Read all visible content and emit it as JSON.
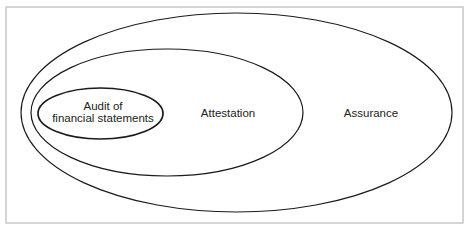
{
  "figure": {
    "kind": "nested-ellipse-euler-diagram",
    "background_color": "#ffffff",
    "frame_color": "#c8c8c8",
    "stroke_color": "#1a1a1a",
    "text_color": "#222222"
  },
  "regions": {
    "outer": {
      "label": "Assurance",
      "label_x": 371,
      "label_y": 117,
      "cx": 236.5,
      "cy": 112.5,
      "rx": 215.5,
      "ry": 99.5
    },
    "middle": {
      "label": "Attestation",
      "label_x": 228,
      "label_y": 117,
      "cx": 167,
      "cy": 112.5,
      "rx": 136,
      "ry": 63.5
    },
    "inner": {
      "label_line1": "Audit of",
      "label_line2": "financial statements",
      "label_x": 103,
      "label_y1": 110,
      "label_y2": 122,
      "cx": 100.5,
      "cy": 113.5,
      "rx": 62.5,
      "ry": 25.5
    }
  },
  "frame": {
    "x": 6,
    "y": 7,
    "width": 457,
    "height": 216
  }
}
